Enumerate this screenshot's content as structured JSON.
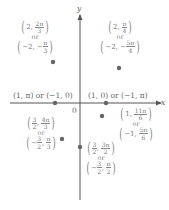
{
  "diagram": {
    "type": "polar coordinate points on Cartesian plane",
    "axes": {
      "x_label": "x",
      "y_label": "y",
      "origin_label": "0"
    },
    "colors": {
      "axis": "#555555",
      "dot": "#666666",
      "text": "#777777"
    },
    "points": [
      {
        "id": "p-1-pi",
        "label": "(1, π) or (−1, 0)",
        "primary": "(1, π)",
        "connector": "or",
        "alternate": "(−1, 0)"
      },
      {
        "id": "p-1-0",
        "label": "(1, 0) or (−1, π)",
        "primary": "(1, 0)",
        "connector": "or",
        "alternate": "(−1, π)"
      },
      {
        "id": "p-2-2pi3",
        "primary": {
          "r": "2",
          "theta_num": "2π",
          "theta_den": "3",
          "sign": ""
        },
        "connector": "or",
        "alternate": {
          "r": "−2",
          "theta_num": "π",
          "theta_den": "3",
          "sign": "−"
        }
      },
      {
        "id": "p-2-pi4",
        "primary": {
          "r": "2",
          "theta_num": "π",
          "theta_den": "4",
          "sign": ""
        },
        "connector": "or",
        "alternate": {
          "r": "−2",
          "theta_num": "5π",
          "theta_den": "4",
          "sign": "−"
        }
      },
      {
        "id": "p-32-4pi3",
        "primary": {
          "r_num": "3",
          "r_den": "2",
          "r_sign": "",
          "theta_num": "4π",
          "theta_den": "3"
        },
        "connector": "or",
        "alternate": {
          "r_num": "3",
          "r_den": "2",
          "r_sign": "−",
          "theta_num": "π",
          "theta_den": "3"
        }
      },
      {
        "id": "p-1-11pi6",
        "primary": {
          "r": "1",
          "theta_num": "11π",
          "theta_den": "6"
        },
        "connector": "or",
        "alternate": {
          "r": "−1",
          "theta_num": "5π",
          "theta_den": "6"
        }
      },
      {
        "id": "p-32-3pi2",
        "primary": {
          "r_num": "3",
          "r_den": "2",
          "r_sign": "",
          "theta_num": "3π",
          "theta_den": "2"
        },
        "connector": "or",
        "alternate": {
          "r_num": "3",
          "r_den": "2",
          "r_sign": "−",
          "theta_num": "π",
          "theta_den": "2"
        }
      }
    ]
  }
}
